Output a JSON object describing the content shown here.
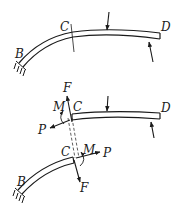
{
  "diagram": {
    "colors": {
      "ink": "#1a1a1a",
      "background": "#ffffff"
    },
    "top_figure": {
      "labels": {
        "B": "B",
        "C": "C",
        "D": "D"
      },
      "elements": [
        "curved-beam",
        "fixed-support-at-B",
        "section-cut-at-C",
        "downward-load",
        "upward-load-at-D"
      ]
    },
    "bottom_figure": {
      "upper_segment": {
        "labels": {
          "C": "C",
          "D": "D",
          "F": "F",
          "M": "M",
          "P": "P"
        }
      },
      "lower_segment": {
        "labels": {
          "B": "B",
          "C": "C",
          "F": "F",
          "M": "M",
          "P": "P"
        }
      }
    }
  }
}
